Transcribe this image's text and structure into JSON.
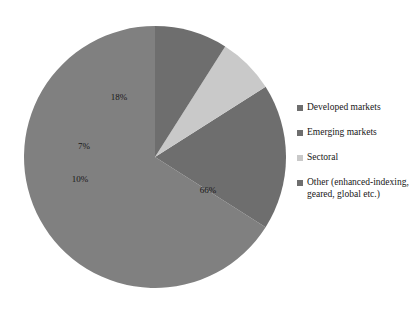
{
  "chart_data": {
    "type": "pie",
    "title": "",
    "subtitle": "",
    "xlabel": "",
    "ylabel": "",
    "grid": false,
    "legend_position": "right",
    "categories": [
      "Developed markets",
      "Emerging markets",
      "Sectoral",
      "Other (enhanced-indexing, geared, global etc.)"
    ],
    "values": [
      66,
      18,
      7,
      10
    ],
    "value_labels": [
      "66%",
      "18%",
      "7%",
      "10%"
    ],
    "colors": [
      "#808080",
      "#6e6e6e",
      "#c9c9c9",
      "#6e6e6e"
    ],
    "slices": [
      {
        "name": "Developed markets",
        "value": 66,
        "label": "66%",
        "color": "#808080",
        "start_angle_deg": 0,
        "end_angle_deg": 237.6,
        "label_x": 208,
        "label_y": 193
      },
      {
        "name": "Emerging markets",
        "value": 18,
        "label": "18%",
        "color": "#6e6e6e",
        "start_angle_deg": 237.6,
        "end_angle_deg": 302.4,
        "label_x": 119,
        "label_y": 100
      },
      {
        "name": "Sectoral",
        "value": 7,
        "label": "7%",
        "color": "#c9c9c9",
        "start_angle_deg": 302.4,
        "end_angle_deg": 327.6,
        "label_x": 84,
        "label_y": 149
      },
      {
        "name": "Other (enhanced-indexing, geared, global etc.)",
        "value": 10,
        "label": "10%",
        "color": "#6e6e6e",
        "start_angle_deg": 327.6,
        "end_angle_deg": 360,
        "label_x": 80,
        "label_y": 182
      }
    ]
  },
  "legend": {
    "items": [
      {
        "label": "Developed markets",
        "color": "#6e6e6e"
      },
      {
        "label": "Emerging markets",
        "color": "#6e6e6e"
      },
      {
        "label": "Sectoral",
        "color": "#c9c9c9"
      },
      {
        "label": "Other (enhanced-indexing,\ngeared, global etc.)",
        "color": "#6e6e6e"
      }
    ]
  }
}
